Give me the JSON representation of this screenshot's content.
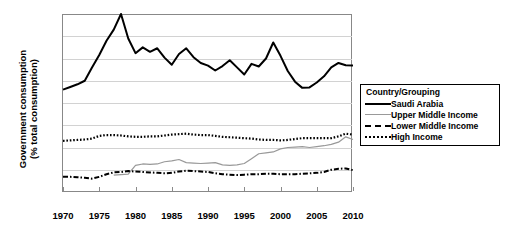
{
  "chart_data": {
    "type": "line",
    "title": "",
    "xlabel": "",
    "ylabel": "Government consumption\n(% total consumption)",
    "xlim": [
      1970,
      2010
    ],
    "ylim": [
      10,
      50
    ],
    "yticks": [
      10,
      15,
      20,
      25,
      30,
      35,
      40,
      45,
      50
    ],
    "xticks": [
      1970,
      1975,
      1980,
      1985,
      1990,
      1995,
      2000,
      2005,
      2010
    ],
    "grid": true,
    "legend_position": "right",
    "legend_title": "Country/Grouping",
    "x": [
      1970,
      1971,
      1972,
      1973,
      1974,
      1975,
      1976,
      1977,
      1978,
      1979,
      1980,
      1981,
      1982,
      1983,
      1984,
      1985,
      1986,
      1987,
      1988,
      1989,
      1990,
      1991,
      1992,
      1993,
      1994,
      1995,
      1996,
      1997,
      1998,
      1999,
      2000,
      2001,
      2002,
      2003,
      2004,
      2005,
      2006,
      2007,
      2008,
      2009,
      2010
    ],
    "series": [
      {
        "name": "Saudi Arabia",
        "style": "solid-black",
        "color": "#000000",
        "values": [
          33.0,
          33.6,
          34.2,
          35.0,
          38.0,
          40.8,
          44.0,
          46.5,
          50.0,
          44.5,
          41.2,
          42.5,
          41.5,
          42.3,
          40.2,
          38.6,
          41.0,
          42.3,
          40.3,
          39.0,
          38.4,
          37.3,
          38.3,
          39.6,
          38.0,
          36.4,
          38.8,
          38.2,
          40.0,
          43.6,
          40.6,
          37.2,
          34.8,
          33.4,
          33.5,
          34.6,
          36.0,
          38.0,
          39.0,
          38.5,
          38.4
        ]
      },
      {
        "name": "Upper Middle Income",
        "style": "solid-grey",
        "color": "#999999",
        "values": [
          null,
          null,
          null,
          null,
          null,
          null,
          null,
          13.8,
          13.9,
          14.0,
          16.0,
          16.3,
          16.2,
          16.3,
          16.8,
          17.0,
          17.3,
          16.6,
          16.5,
          16.4,
          16.5,
          16.6,
          16.1,
          16.0,
          16.1,
          16.4,
          17.5,
          18.6,
          18.8,
          19.0,
          19.7,
          20.0,
          20.1,
          20.2,
          20.0,
          20.2,
          20.4,
          20.7,
          21.2,
          22.4,
          21.8
        ]
      },
      {
        "name": "Lower Middle Income",
        "style": "dashdot-black",
        "color": "#000000",
        "values": [
          13.4,
          13.4,
          13.3,
          13.2,
          13.0,
          13.4,
          14.0,
          14.4,
          14.5,
          14.7,
          14.6,
          14.5,
          14.4,
          14.3,
          14.2,
          14.3,
          14.6,
          14.8,
          14.7,
          14.6,
          14.5,
          14.2,
          14.0,
          13.9,
          13.8,
          13.9,
          14.0,
          14.0,
          14.1,
          14.1,
          14.0,
          14.0,
          14.0,
          14.1,
          14.2,
          14.3,
          14.5,
          15.0,
          15.2,
          15.3,
          14.9
        ]
      },
      {
        "name": "High Income",
        "style": "dotted-black",
        "color": "#000000",
        "values": [
          21.5,
          21.6,
          21.7,
          21.8,
          22.0,
          22.6,
          22.8,
          22.8,
          22.7,
          22.5,
          22.4,
          22.4,
          22.5,
          22.5,
          22.7,
          22.9,
          23.0,
          23.1,
          22.9,
          22.8,
          22.8,
          22.6,
          22.4,
          22.3,
          22.2,
          22.1,
          22.0,
          21.8,
          21.7,
          21.7,
          21.6,
          21.7,
          21.9,
          22.1,
          22.1,
          22.1,
          22.1,
          22.1,
          22.5,
          23.1,
          22.9
        ]
      }
    ],
    "legend_entries": [
      {
        "label": "Saudi Arabia",
        "key": "solid-black"
      },
      {
        "label": "Upper Middle Income",
        "key": "solid-grey"
      },
      {
        "label": "Lower Middle Income",
        "key": "dashdot-black"
      },
      {
        "label": "High Income",
        "key": "dotted-black"
      }
    ]
  }
}
